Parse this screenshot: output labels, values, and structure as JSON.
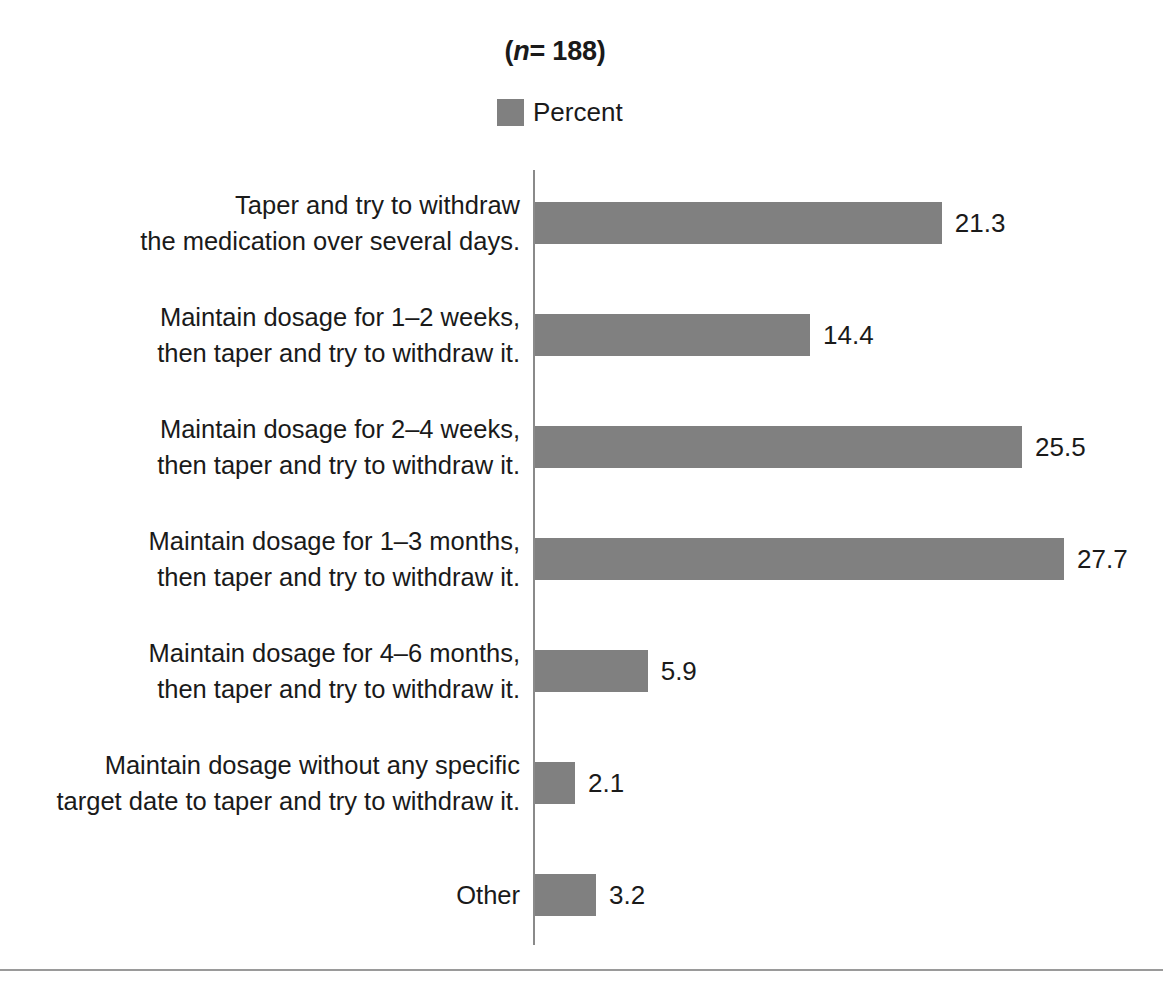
{
  "chart_data": {
    "type": "bar",
    "orientation": "horizontal",
    "title": "(n= 188)",
    "title_parts": {
      "prefix": "(",
      "italic": "n",
      "suffix": "= 188)"
    },
    "xlabel": "",
    "ylabel": "",
    "grid": false,
    "legend": {
      "position": "top-center",
      "entries": [
        {
          "name": "Percent",
          "color": "#808080"
        }
      ]
    },
    "categories": [
      "Taper and try to withdraw\nthe medication over several days.",
      "Maintain dosage for 1–2 weeks,\nthen taper and try to withdraw it.",
      "Maintain dosage for 2–4 weeks,\nthen taper and try to withdraw it.",
      "Maintain dosage for 1–3 months,\nthen taper and try to withdraw it.",
      "Maintain dosage for 4–6 months,\nthen taper and try to withdraw it.",
      "Maintain dosage without any specific\ntarget date to taper and try to withdraw it.",
      "Other"
    ],
    "series": [
      {
        "name": "Percent",
        "color": "#808080",
        "values": [
          21.3,
          14.4,
          25.5,
          27.7,
          5.9,
          2.1,
          3.2
        ]
      }
    ],
    "value_labels": [
      "21.3",
      "14.4",
      "25.5",
      "27.7",
      "5.9",
      "2.1",
      "3.2"
    ],
    "xlim": [
      0,
      30
    ],
    "axis_color": "#8a8a8a",
    "background": "#ffffff"
  },
  "rows": [
    {
      "label": "Taper and try to withdraw\nthe medication over several days.",
      "value": 21.3,
      "value_label": "21.3"
    },
    {
      "label": "Maintain dosage for 1–2 weeks,\nthen taper and try to withdraw it.",
      "value": 14.4,
      "value_label": "14.4"
    },
    {
      "label": "Maintain dosage for 2–4 weeks,\nthen taper and try to withdraw it.",
      "value": 25.5,
      "value_label": "25.5"
    },
    {
      "label": "Maintain dosage for 1–3 months,\nthen taper and try to withdraw it.",
      "value": 27.7,
      "value_label": "27.7"
    },
    {
      "label": "Maintain dosage for 4–6 months,\nthen taper and try to withdraw it.",
      "value": 5.9,
      "value_label": "5.9"
    },
    {
      "label": "Maintain dosage without any specific\ntarget date to taper and try to withdraw it.",
      "value": 2.1,
      "value_label": "2.1"
    },
    {
      "label": "Other",
      "value": 3.2,
      "value_label": "3.2"
    }
  ],
  "legend": {
    "label": "Percent",
    "color": "#808080"
  },
  "title": {
    "prefix": "(",
    "italic": "n",
    "suffix": "= 188)"
  }
}
